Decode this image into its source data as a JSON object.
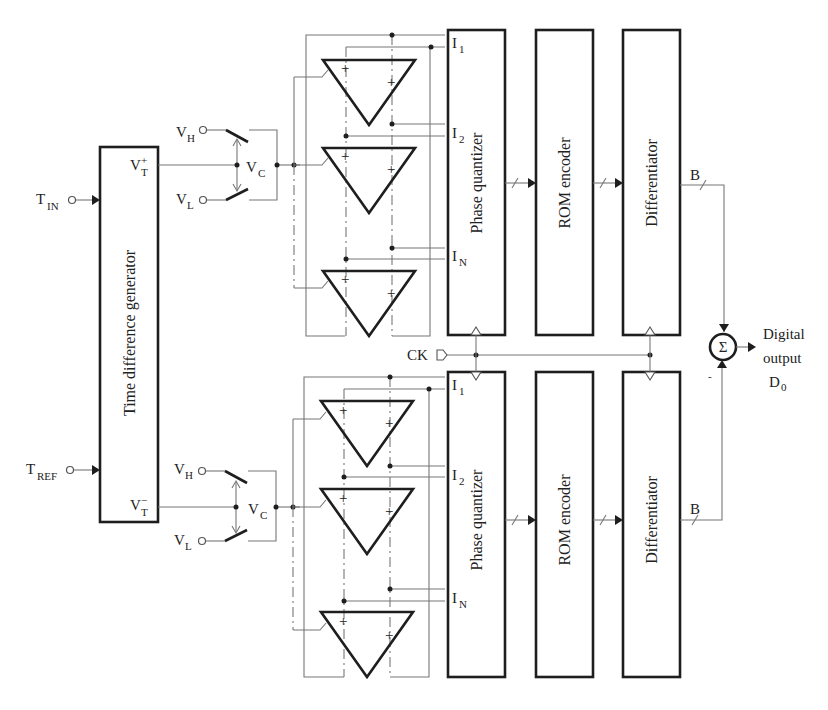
{
  "inputs": {
    "t_in": {
      "main": "T",
      "sub": "IN"
    },
    "t_ref": {
      "main": "T",
      "sub": "REF"
    }
  },
  "blocks": {
    "time_difference_generator": "Time difference generator",
    "phase_quantizer_top": "Phase quantizer",
    "rom_encoder_top": "ROM encoder",
    "differentiator_top": "Differentiator",
    "phase_quantizer_bottom": "Phase quantizer",
    "rom_encoder_bottom": "ROM encoder",
    "differentiator_bottom": "Differentiator"
  },
  "ports": {
    "vt_plus": {
      "main": "V",
      "sub": "T",
      "sup": "+"
    },
    "vt_minus": {
      "main": "V",
      "sub": "T",
      "sup": "−"
    }
  },
  "switches": {
    "vh": {
      "main": "V",
      "sub": "H"
    },
    "vl": {
      "main": "V",
      "sub": "L"
    },
    "vc": {
      "main": "V",
      "sub": "C"
    }
  },
  "quantizer_inputs": [
    {
      "main": "I",
      "sub": "1"
    },
    {
      "main": "I",
      "sub": "2"
    },
    {
      "main": "I",
      "sub": "N"
    }
  ],
  "comparator_signs": {
    "plus": "+",
    "minus": "−"
  },
  "clock": "CK",
  "bus_label": "B",
  "summer": {
    "symbol": "Σ",
    "minus_sign": "-"
  },
  "output": {
    "line1": "Digital",
    "line2": "output",
    "main": "D",
    "sub": "0"
  },
  "colors": {
    "thick_line": "#1e1e1e",
    "thin_line": "#777777",
    "background": "#ffffff"
  }
}
